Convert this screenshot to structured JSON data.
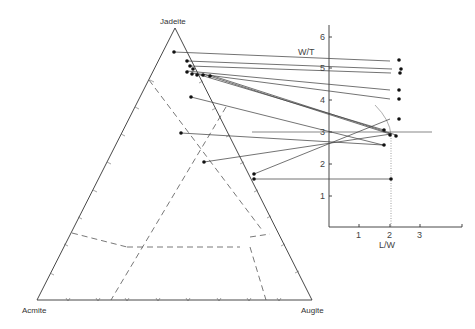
{
  "diagram": {
    "ternary": {
      "apex_labels": {
        "top": "Jadeite",
        "left": "Acmite",
        "right": "Augite"
      },
      "vertices": {
        "top": [
          175,
          28
        ],
        "left": [
          37,
          300
        ],
        "right": [
          312,
          300
        ]
      },
      "field_boundaries": "dashed"
    },
    "graph": {
      "ylabel": "W/T",
      "xlabel": "L/W",
      "y_ticks": [
        "1",
        "2",
        "3",
        "4",
        "5",
        "6"
      ],
      "x_ticks": [
        "1",
        "2",
        "3"
      ],
      "origin_px": [
        329,
        227
      ],
      "px_per_unit_x": 30.5,
      "px_per_unit_y": 31.7,
      "reference_lines": {
        "horizontal_at_wt": 3,
        "vertical_dotted_at_lw": 2
      }
    },
    "connections": [
      {
        "tri": [
          174,
          52
        ],
        "graph": [
          390,
          61
        ]
      },
      {
        "tri": [
          187,
          61
        ],
        "graph": [
          392,
          69
        ]
      },
      {
        "tri": [
          190,
          66
        ],
        "graph": [
          391,
          73
        ]
      },
      {
        "tri": [
          187,
          71
        ],
        "graph": [
          390,
          90
        ]
      },
      {
        "tri": [
          192,
          73
        ],
        "graph": [
          390,
          99
        ]
      },
      {
        "tri": [
          197,
          74
        ],
        "graph": [
          384,
          130
        ]
      },
      {
        "tri": [
          203,
          74
        ],
        "graph": [
          390,
          134
        ]
      },
      {
        "tri": [
          210,
          75
        ],
        "graph": [
          396,
          135
        ]
      },
      {
        "tri": [
          191,
          97
        ],
        "graph": [
          383,
          145
        ]
      },
      {
        "tri": [
          181,
          133
        ],
        "graph": [
          392,
          119
        ]
      },
      {
        "tri": [
          204,
          162
        ],
        "graph": [
          391,
          134
        ]
      },
      {
        "tri": [
          254,
          174
        ],
        "graph": [
          390,
          179
        ]
      },
      {
        "tri": [
          254,
          179
        ],
        "graph": [
          390,
          179
        ]
      }
    ]
  }
}
